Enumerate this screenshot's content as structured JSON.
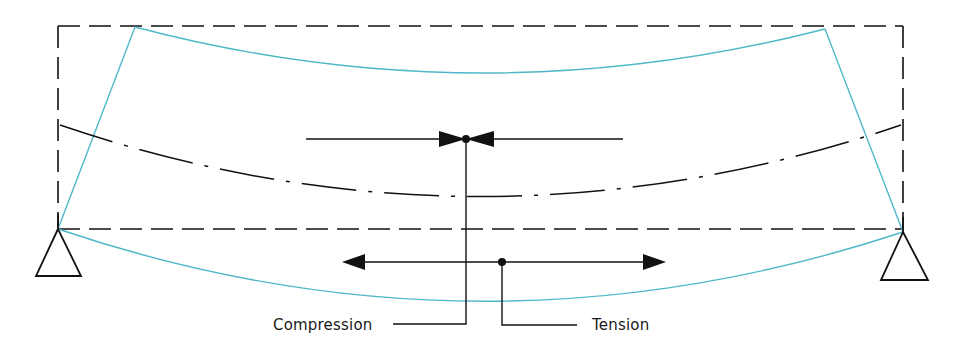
{
  "diagram": {
    "labels": {
      "compression": "Compression",
      "tension": "Tension"
    },
    "colors": {
      "beam_deformed": "#4fb8c8",
      "ink": "#111111",
      "background": "#ffffff"
    },
    "elements": {
      "original_beam": "dashed rectangle (undeformed beam outline)",
      "deformed_beam": "cyan curved outline (bent beam)",
      "neutral_axis": "dash-dot curved line",
      "compression_arrows": "inward-pointing arrow pair (bowtie) on upper fibre line",
      "tension_arrows": "outward-pointing arrow pair on lower fibre line",
      "supports": [
        "left triangular support",
        "right triangular support"
      ]
    }
  }
}
